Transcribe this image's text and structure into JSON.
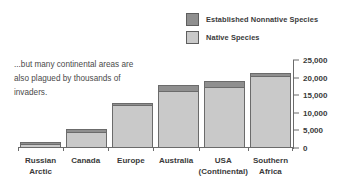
{
  "legend": {
    "items": [
      {
        "label": "Established Nonnative Species",
        "key": "nonnative",
        "color": "#8f8f8f"
      },
      {
        "label": "Native Species",
        "key": "native",
        "color": "#c9c9c9"
      }
    ]
  },
  "annotation": {
    "line1": "...but many continental areas are",
    "line2": "also plagued by thousands of",
    "line3": "invaders."
  },
  "chart_data": {
    "type": "bar",
    "stacked": true,
    "title": "",
    "xlabel": "",
    "ylabel": "",
    "ylim": [
      0,
      25000
    ],
    "ytick_step": 5000,
    "ytick_labels": [
      "25,000",
      "20,000",
      "15,000",
      "10,000",
      "5,000",
      "0"
    ],
    "ytick_values": [
      25000,
      20000,
      15000,
      10000,
      5000,
      0
    ],
    "grid": false,
    "legend_position": "top-right",
    "categories": [
      "Russian Arctic",
      "Canada",
      "Europe",
      "Australia",
      "USA (Continental)",
      "Southern Africa"
    ],
    "category_lines": [
      [
        "Russian",
        "Arctic"
      ],
      [
        "Canada",
        ""
      ],
      [
        "Europe",
        ""
      ],
      [
        "Australia",
        ""
      ],
      [
        "USA",
        "(Continental)"
      ],
      [
        "Southern",
        "Africa"
      ]
    ],
    "series": [
      {
        "name": "Native Species",
        "color": "#c9c9c9",
        "values": [
          1100,
          4300,
          12000,
          15900,
          17000,
          20300
        ]
      },
      {
        "name": "Established Nonnative Species",
        "color": "#8f8f8f",
        "values": [
          200,
          700,
          600,
          1700,
          1800,
          600
        ]
      }
    ],
    "totals": [
      1300,
      5000,
      12600,
      17600,
      18800,
      20900
    ]
  },
  "colors": {
    "native": "#c9c9c9",
    "nonnative": "#8f8f8f",
    "outline": "#6b6b6b",
    "text": "#3a3a3a",
    "background": "#ffffff"
  }
}
